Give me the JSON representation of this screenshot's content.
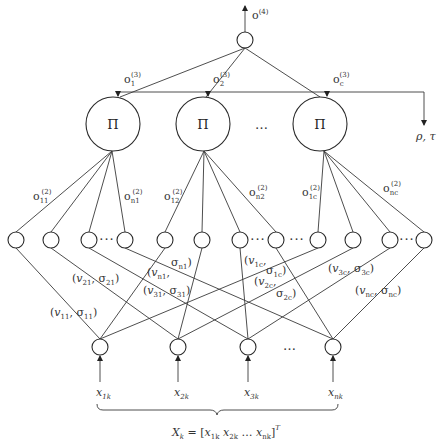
{
  "diagram": {
    "output": {
      "label": "o",
      "sup": "(4)"
    },
    "feedback_label": "ρ, τ",
    "product_nodes": [
      {
        "symbol": "Π",
        "out_label": "o",
        "out_sub": "1",
        "out_sup": "(3)"
      },
      {
        "symbol": "Π",
        "out_label": "o",
        "out_sub": "2",
        "out_sup": "(3)"
      },
      {
        "symbol": "Π",
        "out_label": "o",
        "out_sub": "c",
        "out_sup": "(3)"
      }
    ],
    "product_ellipsis": "…",
    "membership_outputs": [
      {
        "label": "o",
        "sub": "11",
        "sup": "(2)"
      },
      {
        "label": "o",
        "sub": "n1",
        "sup": "(2)"
      },
      {
        "label": "o",
        "sub": "12",
        "sup": "(2)"
      },
      {
        "label": "o",
        "sub": "n2",
        "sup": "(2)"
      },
      {
        "label": "o",
        "sub": "1c",
        "sup": "(2)"
      },
      {
        "label": "o",
        "sub": "nc",
        "sup": "(2)"
      }
    ],
    "parameter_labels": [
      {
        "v": "v",
        "vsub": "11",
        "s": "σ",
        "ssub": "11"
      },
      {
        "v": "v",
        "vsub": "21",
        "s": "σ",
        "ssub": "21"
      },
      {
        "v": "v",
        "vsub": "n1",
        "s": "σ",
        "ssub": "n1"
      },
      {
        "v": "v",
        "vsub": "31",
        "s": "σ",
        "ssub": "31"
      },
      {
        "v": "v",
        "vsub": "1c",
        "s": "σ",
        "ssub": "1c"
      },
      {
        "v": "v",
        "vsub": "2c",
        "s": "σ",
        "ssub": "2c"
      },
      {
        "v": "v",
        "vsub": "3c",
        "s": "σ",
        "ssub": "3c"
      },
      {
        "v": "v",
        "vsub": "nc",
        "s": "σ",
        "ssub": "nc"
      }
    ],
    "inputs": [
      {
        "label": "x",
        "sub": "1k"
      },
      {
        "label": "x",
        "sub": "2k"
      },
      {
        "label": "x",
        "sub": "3k"
      },
      {
        "label": "x",
        "sub": "nk"
      }
    ],
    "input_ellipsis": "…",
    "hidden_ellipsis": "···",
    "input_vector": {
      "lhs": "X",
      "lhs_sub": "k",
      "eq": " = [",
      "items": [
        {
          "label": "x",
          "sub": "1k"
        },
        {
          "label": "x",
          "sub": "2k"
        },
        {
          "label": "…",
          "sub": ""
        },
        {
          "label": "x",
          "sub": "nk"
        }
      ],
      "close": "]",
      "sup": "T"
    }
  }
}
